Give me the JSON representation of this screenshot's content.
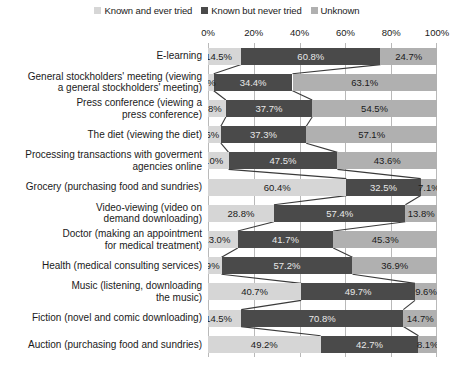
{
  "chart_data": {
    "type": "bar",
    "subtype": "stacked-horizontal-100pct",
    "title": "",
    "xlabel": "",
    "ylabel": "",
    "xlim": [
      0,
      100
    ],
    "xticks": [
      0,
      20,
      40,
      60,
      80,
      100
    ],
    "xticklabels": [
      "0%",
      "20%",
      "40%",
      "60%",
      "80%",
      "100%"
    ],
    "grid": true,
    "legend_position": "top-center",
    "legend": [
      {
        "name": "Known and ever tried",
        "color": "#d6d6d6"
      },
      {
        "name": "Known but never tried",
        "color": "#4a4a4a"
      },
      {
        "name": "Unknown",
        "color": "#b0b0b0"
      }
    ],
    "series": [
      {
        "name": "Known and ever tried",
        "color": "#d6d6d6",
        "values": [
          14.5,
          2.5,
          7.8,
          5.6,
          9.0,
          60.4,
          28.8,
          13.0,
          5.9,
          40.7,
          14.5,
          49.2
        ]
      },
      {
        "name": "Known but never tried",
        "color": "#4a4a4a",
        "values": [
          60.8,
          34.4,
          37.7,
          37.3,
          47.5,
          32.5,
          57.4,
          41.7,
          57.2,
          49.7,
          70.8,
          42.7
        ]
      },
      {
        "name": "Unknown",
        "color": "#b0b0b0",
        "values": [
          24.7,
          63.1,
          54.5,
          57.1,
          43.6,
          7.1,
          13.8,
          45.3,
          36.9,
          9.6,
          14.7,
          8.1
        ]
      }
    ],
    "categories": [
      "E-learning",
      "General stockholders' meeting (viewing a general stockholders' meeting)",
      "Press conference (viewing a press conference)",
      "The diet (viewing the diet)",
      "Processing transactions with goverment agencies online",
      "Grocery (purchasing food and sundries)",
      "Video-viewing (video on demand downloading)",
      "Doctor (making an appointment for medical treatment)",
      "Health (medical consulting services)",
      "Music (listening, downloading the music)",
      "Fiction (novel and comic downloading)",
      "Auction (purchasing food and sundries)"
    ],
    "category_lines": [
      [
        "E-learning"
      ],
      [
        "General stockholders' meeting (viewing",
        "a general stockholders' meeting)"
      ],
      [
        "Press conference (viewing a",
        "press conference)"
      ],
      [
        "The diet (viewing the diet)"
      ],
      [
        "Processing transactions with goverment",
        "agencies online"
      ],
      [
        "Grocery (purchasing food and sundries)"
      ],
      [
        "Video-viewing (video on",
        "demand downloading)"
      ],
      [
        "Doctor (making an appointment",
        "for medical treatment)"
      ],
      [
        "Health (medical consulting services)"
      ],
      [
        "Music (listening, downloading",
        "the music)"
      ],
      [
        "Fiction (novel and comic downloading)"
      ],
      [
        "Auction (purchasing food and sundries)"
      ]
    ],
    "bars": [
      {
        "category": "E-learning",
        "segments": [
          {
            "series": "Known and ever tried",
            "value": 14.5,
            "label": "14.5%"
          },
          {
            "series": "Known but never tried",
            "value": 60.8,
            "label": "60.8%"
          },
          {
            "series": "Unknown",
            "value": 24.7,
            "label": "24.7%"
          }
        ]
      },
      {
        "category": "General stockholders' meeting (viewing a general stockholders' meeting)",
        "segments": [
          {
            "series": "Known and ever tried",
            "value": 2.5,
            "label": "2.5%"
          },
          {
            "series": "Known but never tried",
            "value": 34.4,
            "label": "34.4%"
          },
          {
            "series": "Unknown",
            "value": 63.1,
            "label": "63.1%"
          }
        ]
      },
      {
        "category": "Press conference (viewing a press conference)",
        "segments": [
          {
            "series": "Known and ever tried",
            "value": 7.8,
            "label": "7.8%"
          },
          {
            "series": "Known but never tried",
            "value": 37.7,
            "label": "37.7%"
          },
          {
            "series": "Unknown",
            "value": 54.5,
            "label": "54.5%"
          }
        ]
      },
      {
        "category": "The diet (viewing the diet)",
        "segments": [
          {
            "series": "Known and ever tried",
            "value": 5.6,
            "label": "5.6%"
          },
          {
            "series": "Known but never tried",
            "value": 37.3,
            "label": "37.3%"
          },
          {
            "series": "Unknown",
            "value": 57.1,
            "label": "57.1%"
          }
        ]
      },
      {
        "category": "Processing transactions with goverment agencies online",
        "segments": [
          {
            "series": "Known and ever tried",
            "value": 9.0,
            "label": "9.0%"
          },
          {
            "series": "Known but never tried",
            "value": 47.5,
            "label": "47.5%"
          },
          {
            "series": "Unknown",
            "value": 43.6,
            "label": "43.6%"
          }
        ]
      },
      {
        "category": "Grocery (purchasing food and sundries)",
        "segments": [
          {
            "series": "Known and ever tried",
            "value": 60.4,
            "label": "60.4%"
          },
          {
            "series": "Known but never tried",
            "value": 32.5,
            "label": "32.5%"
          },
          {
            "series": "Unknown",
            "value": 7.1,
            "label": "7.1%"
          }
        ]
      },
      {
        "category": "Video-viewing (video on demand downloading)",
        "segments": [
          {
            "series": "Known and ever tried",
            "value": 28.8,
            "label": "28.8%"
          },
          {
            "series": "Known but never tried",
            "value": 57.4,
            "label": "57.4%"
          },
          {
            "series": "Unknown",
            "value": 13.8,
            "label": "13.8%"
          }
        ]
      },
      {
        "category": "Doctor (making an appointment for medical treatment)",
        "segments": [
          {
            "series": "Known and ever tried",
            "value": 13.0,
            "label": "13.0%"
          },
          {
            "series": "Known but never tried",
            "value": 41.7,
            "label": "41.7%"
          },
          {
            "series": "Unknown",
            "value": 45.3,
            "label": "45.3%"
          }
        ]
      },
      {
        "category": "Health (medical consulting services)",
        "segments": [
          {
            "series": "Known and ever tried",
            "value": 5.9,
            "label": "5.9%"
          },
          {
            "series": "Known but never tried",
            "value": 57.2,
            "label": "57.2%"
          },
          {
            "series": "Unknown",
            "value": 36.9,
            "label": "36.9%"
          }
        ]
      },
      {
        "category": "Music (listening, downloading the music)",
        "segments": [
          {
            "series": "Known and ever tried",
            "value": 40.7,
            "label": "40.7%"
          },
          {
            "series": "Known but never tried",
            "value": 49.7,
            "label": "49.7%"
          },
          {
            "series": "Unknown",
            "value": 9.6,
            "label": "9.6%"
          }
        ]
      },
      {
        "category": "Fiction (novel and comic downloading)",
        "segments": [
          {
            "series": "Known and ever tried",
            "value": 14.5,
            "label": "14.5%"
          },
          {
            "series": "Known but never tried",
            "value": 70.8,
            "label": "70.8%"
          },
          {
            "series": "Unknown",
            "value": 14.7,
            "label": "14.7%"
          }
        ]
      },
      {
        "category": "Auction (purchasing food and sundries)",
        "segments": [
          {
            "series": "Known and ever tried",
            "value": 49.2,
            "label": "49.2%"
          },
          {
            "series": "Known but never tried",
            "value": 42.7,
            "label": "42.7%"
          },
          {
            "series": "Unknown",
            "value": 8.1,
            "label": "8.1%"
          }
        ]
      }
    ]
  },
  "colors": {
    "ever_tried": "#d6d6d6",
    "never_tried": "#4a4a4a",
    "unknown": "#b0b0b0",
    "grid": "#b9b9b9",
    "connector": "#3a3a3a",
    "text": "#1a1a1a",
    "text_on_dark": "#e8e8e8",
    "background": "#ffffff"
  }
}
